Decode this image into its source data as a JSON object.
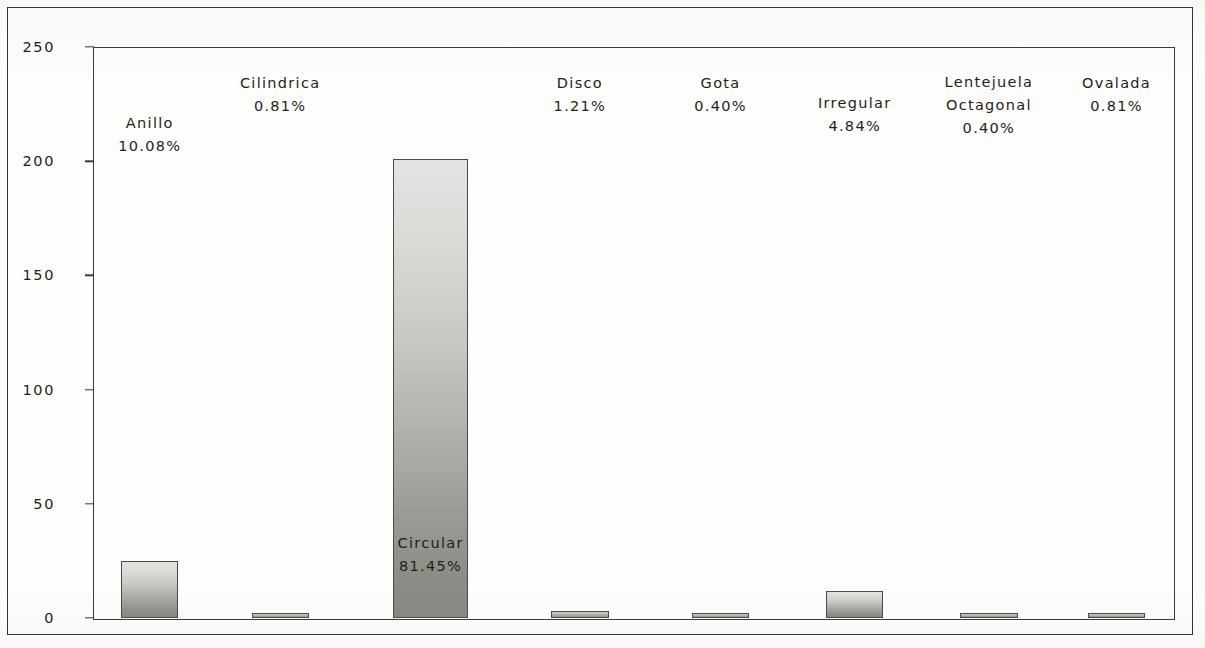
{
  "chart_data": {
    "type": "bar",
    "title": "",
    "subtitle": "",
    "xlabel": "",
    "ylabel": "",
    "ylim": [
      0,
      250
    ],
    "yticks": [
      0,
      50,
      100,
      150,
      200,
      250
    ],
    "ytick_labels": [
      "0",
      "50",
      "100",
      "150",
      "200",
      "250"
    ],
    "grid": false,
    "legend": "none",
    "categories": [
      "Anillo",
      "Cilindrica",
      "Circular",
      "Disco",
      "Gota",
      "Irregular",
      "Lentejuela Octagonal",
      "Ovalada"
    ],
    "values": [
      25,
      2,
      201,
      3,
      1,
      12,
      1,
      2
    ],
    "data_labels": [
      "10.08%",
      "0.81%",
      "81.45%",
      "1.21%",
      "0.40%",
      "4.84%",
      "0.40%",
      "0.81%"
    ],
    "percentages": [
      10.08,
      0.81,
      81.45,
      1.21,
      0.4,
      4.84,
      0.4,
      0.81
    ],
    "bars": [
      {
        "category": "Anillo",
        "category_lines": [
          "Anillo"
        ],
        "value": 25,
        "label": "10.08%",
        "center_pct": 5.25,
        "width_pct": 5.3,
        "label_bottom_px": 460
      },
      {
        "category": "Cilindrica",
        "category_lines": [
          "Cilindrica"
        ],
        "value": 2,
        "label": "0.81%",
        "center_pct": 17.3,
        "width_pct": 5.3,
        "label_bottom_px": 500
      },
      {
        "category": "Circular",
        "category_lines": [
          "Circular"
        ],
        "value": 201,
        "label": "81.45%",
        "center_pct": 31.2,
        "width_pct": 7.0,
        "label_bottom_px": 40
      },
      {
        "category": "Disco",
        "category_lines": [
          "Disco"
        ],
        "value": 3,
        "label": "1.21%",
        "center_pct": 45.0,
        "width_pct": 5.3,
        "label_bottom_px": 500
      },
      {
        "category": "Gota",
        "category_lines": [
          "Gota"
        ],
        "value": 1,
        "label": "0.40%",
        "center_pct": 58.0,
        "width_pct": 5.3,
        "label_bottom_px": 500
      },
      {
        "category": "Irregular",
        "category_lines": [
          "Irregular"
        ],
        "value": 12,
        "label": "4.84%",
        "center_pct": 70.4,
        "width_pct": 5.3,
        "label_bottom_px": 480
      },
      {
        "category": "Lentejuela Octagonal",
        "category_lines": [
          "Lentejuela",
          "Octagonal"
        ],
        "value": 1,
        "label": "0.40%",
        "center_pct": 82.8,
        "width_pct": 5.3,
        "label_bottom_px": 478
      },
      {
        "category": "Ovalada",
        "category_lines": [
          "Ovalada"
        ],
        "value": 2,
        "label": "0.81%",
        "center_pct": 94.6,
        "width_pct": 5.3,
        "label_bottom_px": 500
      }
    ],
    "colors": {
      "bar_fill_top": "#e3e3e1",
      "bar_fill_bottom": "#888883",
      "bar_border": "#4a4a46",
      "axis": "#3a3a36",
      "text": "#1d1d1b",
      "background": "#ffffff"
    }
  }
}
